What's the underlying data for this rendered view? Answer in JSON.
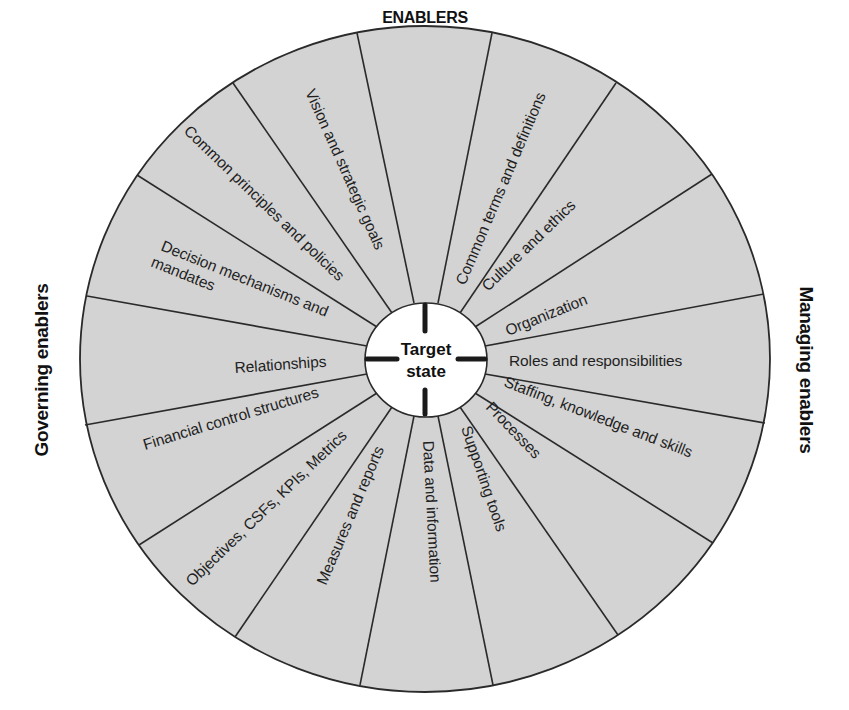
{
  "diagram": {
    "type": "wheel",
    "title": "ENABLERS",
    "center_label_line1": "Target",
    "center_label_line2": "state",
    "left_side_label": "Governing enablers",
    "right_side_label": "Managing enablers",
    "segment_count": 16,
    "colors": {
      "segment_fill": "#d3d3d3",
      "stroke": "#2a2a2a",
      "hub_fill": "#ffffff",
      "text": "#1f1f1f"
    },
    "governing_enablers": [
      "Vision and strategic goals",
      "Common principles and policies",
      "Decision mechanisms and",
      "mandates",
      "Relationships",
      "Financial control structures",
      "Objectives, CSFs, KPIs, Metrics",
      "Measures and reports"
    ],
    "managing_enablers": [
      "Common terms and definitions",
      "Culture and ethics",
      "Organization",
      "Roles and responsibilities",
      "Staffing, knowledge and skills",
      "Processes",
      "Supporting tools",
      "Data and information"
    ]
  }
}
